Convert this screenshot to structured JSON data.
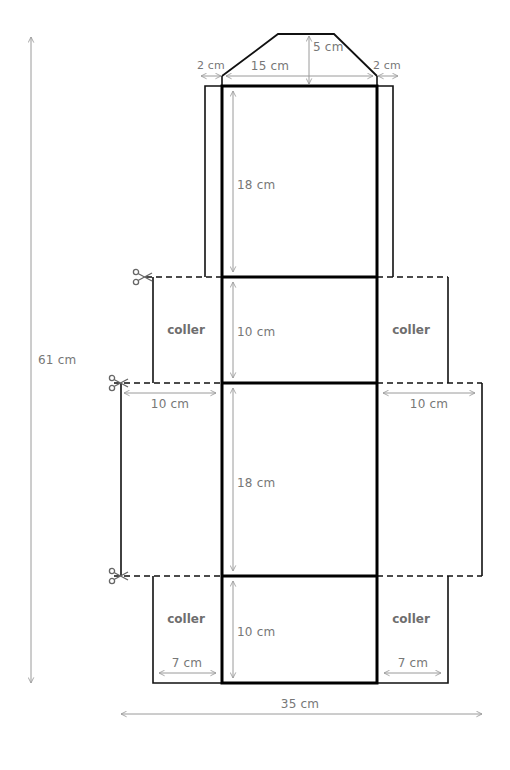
{
  "diagram": {
    "type": "box-net-template",
    "colors": {
      "outline": "#111111",
      "dimension": "#9a9a9a",
      "text": "#777777",
      "glue_text": "#6e6e6e"
    },
    "dimensions": {
      "total_height": "61 cm",
      "total_width": "35 cm",
      "flap_height": "5 cm",
      "flap_width": "15 cm",
      "side_strip_left": "2 cm",
      "side_strip_right": "2 cm",
      "panel_top_height": "18 cm",
      "panel_upper_mid_height": "10 cm",
      "panel_lower_mid_height": "18 cm",
      "panel_bottom_height": "10 cm",
      "wing_left_width": "10 cm",
      "wing_right_width": "10 cm",
      "bottom_left_width": "7 cm",
      "bottom_right_width": "7 cm"
    },
    "glue_labels": {
      "upper_left": "coller",
      "upper_right": "coller",
      "lower_left": "coller",
      "lower_right": "coller"
    },
    "cut_marks": [
      "scissors-upper",
      "scissors-middle",
      "scissors-lower"
    ]
  }
}
